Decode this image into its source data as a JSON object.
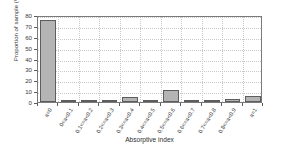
{
  "chart_data": {
    "type": "bar",
    "title": "",
    "xlabel": "Absorptive index",
    "ylabel": "Proportion of sample (%)",
    "categories": [
      "a=0",
      "0<a<0.1",
      "0.1<=a<0.2",
      "0.2<=a<0.3",
      "0.3<=a<0.4",
      "0.4<=a<0.5",
      "0.5<=a<0.6",
      "0.6<=a<0.7",
      "0.7<=a<0.8",
      "0.8<=a<0.9",
      "a=1"
    ],
    "values": [
      75.5,
      1.5,
      0.3,
      0.3,
      4.2,
      1.7,
      11.2,
      0.2,
      0.2,
      3.0,
      5.3
    ],
    "ylim": [
      0,
      80
    ],
    "yticks": [
      0,
      10,
      20,
      30,
      40,
      50,
      60,
      70,
      80
    ],
    "ytick_labels": [
      "0",
      "10",
      "20",
      "30",
      "40",
      "50",
      "60",
      "70",
      "80"
    ],
    "grid": true,
    "grid_style": "dotted",
    "legend": "none",
    "bar_fill_color": "#b4b4b4",
    "bar_edge_color": "#5d5d5d",
    "axis_color": "#7a7a7a",
    "text_color": "#3b3b3b",
    "background_color": "#ffffff"
  }
}
